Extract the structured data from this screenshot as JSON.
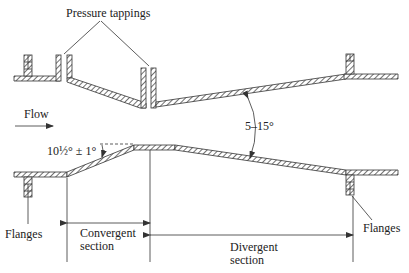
{
  "labels": {
    "pressure_tappings": "Pressure tappings",
    "flow": "Flow",
    "divergent_angle": "5–15°",
    "convergent_angle": "10½° ± 1°",
    "flanges_left": "Flanges",
    "flanges_right": "Flanges",
    "convergent_line1": "Convergent",
    "convergent_line2": "section",
    "divergent_line1": "Divergent",
    "divergent_line2": "section"
  },
  "colors": {
    "ink": "#333333",
    "background": "#ffffff"
  }
}
